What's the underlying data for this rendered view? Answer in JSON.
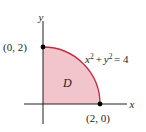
{
  "figure": {
    "axis_labels": {
      "x": "x",
      "y": "y"
    },
    "points": [
      {
        "label": "(0, 2)",
        "coords": [
          0,
          2
        ]
      },
      {
        "label": "(2, 0)",
        "coords": [
          2,
          0
        ]
      }
    ],
    "curve": {
      "equation_lhs_x": "x",
      "equation_lhs_y": "y",
      "exponent": "2",
      "plus": "+",
      "equals": "= 4",
      "description": "quarter circle of radius 2 in first quadrant"
    },
    "region": {
      "label": "D",
      "fill_color": "#f2c4cb",
      "edge_color": "#c4283e"
    },
    "colors": {
      "axis": "#231f20",
      "point": "#000000"
    }
  }
}
